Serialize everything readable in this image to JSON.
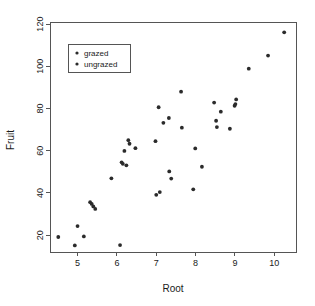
{
  "chart_data": {
    "type": "scatter",
    "title": "",
    "xlabel": "Root",
    "ylabel": "Fruit",
    "xlim": [
      4.3,
      10.55
    ],
    "ylim": [
      12,
      121
    ],
    "xticks": [
      5,
      6,
      7,
      8,
      9,
      10
    ],
    "yticks": [
      20,
      40,
      60,
      80,
      100,
      120
    ],
    "grid": false,
    "legend": {
      "position": "top-left",
      "entries": [
        {
          "label": "grazed",
          "marker": "filled-circle",
          "color": "#2b2b2b"
        },
        {
          "label": "ungrazed",
          "marker": "filled-circle",
          "color": "#2b2b2b"
        }
      ]
    },
    "series": [
      {
        "name": "grazed",
        "marker": "filled-circle",
        "color": "#2b2b2b",
        "points": [
          {
            "x": 4.51,
            "y": 19.1
          },
          {
            "x": 4.93,
            "y": 15.1
          },
          {
            "x": 5.0,
            "y": 24.3
          },
          {
            "x": 5.16,
            "y": 19.4
          },
          {
            "x": 5.32,
            "y": 35.6
          },
          {
            "x": 5.36,
            "y": 34.8
          },
          {
            "x": 5.4,
            "y": 33.6
          },
          {
            "x": 5.45,
            "y": 32.4
          },
          {
            "x": 5.86,
            "y": 46.9
          },
          {
            "x": 6.08,
            "y": 15.3
          },
          {
            "x": 6.12,
            "y": 54.5
          },
          {
            "x": 6.15,
            "y": 53.8
          },
          {
            "x": 6.19,
            "y": 59.9
          },
          {
            "x": 6.24,
            "y": 53.1
          },
          {
            "x": 6.29,
            "y": 65.0
          },
          {
            "x": 6.32,
            "y": 63.3
          },
          {
            "x": 6.47,
            "y": 61.2
          },
          {
            "x": 6.98,
            "y": 64.5
          },
          {
            "x": 7.0,
            "y": 39.1
          },
          {
            "x": 7.06,
            "y": 80.6
          },
          {
            "x": 7.09,
            "y": 40.4
          },
          {
            "x": 7.18,
            "y": 73.2
          },
          {
            "x": 7.32,
            "y": 75.5
          },
          {
            "x": 7.33,
            "y": 50.2
          },
          {
            "x": 7.38,
            "y": 46.8
          }
        ]
      },
      {
        "name": "ungrazed",
        "marker": "filled-circle",
        "color": "#2b2b2b",
        "points": [
          {
            "x": 7.63,
            "y": 88.0
          },
          {
            "x": 7.65,
            "y": 70.9
          },
          {
            "x": 7.94,
            "y": 41.7
          },
          {
            "x": 7.99,
            "y": 61.1
          },
          {
            "x": 8.16,
            "y": 52.4
          },
          {
            "x": 8.47,
            "y": 82.8
          },
          {
            "x": 8.52,
            "y": 74.2
          },
          {
            "x": 8.54,
            "y": 71.2
          },
          {
            "x": 8.64,
            "y": 78.5
          },
          {
            "x": 8.87,
            "y": 70.4
          },
          {
            "x": 8.99,
            "y": 81.3
          },
          {
            "x": 9.01,
            "y": 82.1
          },
          {
            "x": 9.03,
            "y": 84.3
          },
          {
            "x": 9.35,
            "y": 98.9
          },
          {
            "x": 9.84,
            "y": 105.1
          },
          {
            "x": 10.25,
            "y": 116.1
          }
        ]
      }
    ]
  },
  "axes": {
    "x_title": "Root",
    "y_title": "Fruit"
  }
}
